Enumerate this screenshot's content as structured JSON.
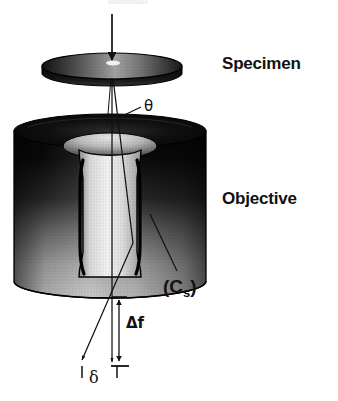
{
  "figure": {
    "background_color": "#ffffff",
    "width": 338,
    "height": 401,
    "cropped_top_caption": "Illuminati"
  },
  "labels": {
    "specimen": "Specimen",
    "objective": "Objective",
    "spherical_aberration": "(C",
    "spherical_aberration_sub": "s",
    "spherical_aberration_close": ")",
    "scattering_angle": "θ",
    "defocus": "Δf",
    "disc_of_least_confusion": "δ"
  },
  "components": {
    "incident_beam": {
      "name": "incident-electron-beam",
      "direction": "downward",
      "x": 112,
      "y_start": 14,
      "y_end": 56
    },
    "specimen_disc": {
      "name": "specimen-disc",
      "center_x": 112,
      "center_y": 66,
      "radius_x": 70,
      "radius_y": 13,
      "thickness": 9,
      "fill": "#151515",
      "top_highlight": "#d9d9d9"
    },
    "objective_lens": {
      "name": "objective-lens-body",
      "left": 14,
      "right": 206,
      "top": 131,
      "bottom": 281,
      "ellipse_ry": 17,
      "bore_radius_x": 42,
      "fill_top": "#0c0c0c",
      "fill_bottom": "#b4b4b4"
    },
    "optic_axis": {
      "name": "optic-axis-ray",
      "x": 112,
      "y_start": 78,
      "y_end": 368
    },
    "aberrated_ray": {
      "name": "aberrated-marginal-ray",
      "y_start": 78,
      "y_end": 366,
      "crossover_y": 248
    }
  },
  "dimensions": {
    "defocus_bar": {
      "name": "defocus-dimension",
      "x": 119,
      "y_top": 296,
      "y_bottom": 365,
      "label": "Δf"
    },
    "delta_bar": {
      "name": "delta-dimension",
      "x_left": 82,
      "x_right": 118,
      "y": 372,
      "label": "δ"
    }
  },
  "leader_lines": {
    "theta": {
      "name": "theta-leader",
      "from_x": 142,
      "from_y": 107,
      "to_x": 118,
      "to_y": 118
    },
    "cs": {
      "name": "cs-leader",
      "from_x": 178,
      "from_y": 272,
      "to_x": 150,
      "to_y": 215
    }
  },
  "colors": {
    "ink": "#111111",
    "background": "#ffffff",
    "metal_dark": "#0b0b0b",
    "metal_light": "#cfcfcf"
  }
}
